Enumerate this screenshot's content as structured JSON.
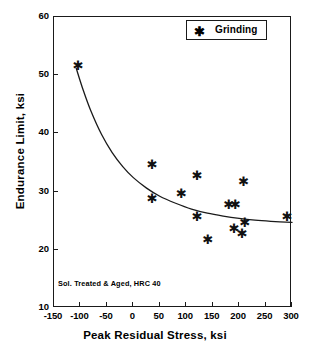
{
  "chart_data": {
    "type": "scatter",
    "title": "",
    "xlabel": "Peak Residual Stress, ksi",
    "ylabel": "Endurance Limit, ksi",
    "xlim": [
      -150,
      300
    ],
    "ylim": [
      10,
      60
    ],
    "xticks": [
      -150,
      -100,
      -50,
      0,
      50,
      100,
      150,
      200,
      250,
      300
    ],
    "yticks": [
      10,
      20,
      30,
      40,
      50,
      60
    ],
    "xticklabels": [
      "-150",
      "-100",
      "-50",
      "0",
      "50",
      "100",
      "150",
      "200",
      "250",
      "300"
    ],
    "yticklabels": [
      "10",
      "20",
      "30",
      "40",
      "50",
      "60"
    ],
    "grid": false,
    "legend_position": "top-right",
    "series": [
      {
        "name": "Grinding",
        "marker": "asterisk",
        "points": [
          {
            "x": -105,
            "y": 52
          },
          {
            "x": 35,
            "y": 35
          },
          {
            "x": 35,
            "y": 29
          },
          {
            "x": 90,
            "y": 30
          },
          {
            "x": 120,
            "y": 33
          },
          {
            "x": 120,
            "y": 26
          },
          {
            "x": 140,
            "y": 22
          },
          {
            "x": 180,
            "y": 28
          },
          {
            "x": 192,
            "y": 28
          },
          {
            "x": 190,
            "y": 24
          },
          {
            "x": 205,
            "y": 23
          },
          {
            "x": 208,
            "y": 32
          },
          {
            "x": 210,
            "y": 25
          },
          {
            "x": 290,
            "y": 26
          }
        ]
      }
    ],
    "fit_curve": {
      "name": "trend",
      "points": [
        {
          "x": -108,
          "y": 51.2
        },
        {
          "x": -95,
          "y": 47.5
        },
        {
          "x": -80,
          "y": 43.8
        },
        {
          "x": -60,
          "y": 39.8
        },
        {
          "x": -40,
          "y": 36.7
        },
        {
          "x": -20,
          "y": 34.3
        },
        {
          "x": 0,
          "y": 32.4
        },
        {
          "x": 25,
          "y": 30.6
        },
        {
          "x": 50,
          "y": 29.2
        },
        {
          "x": 80,
          "y": 28.0
        },
        {
          "x": 110,
          "y": 27.0
        },
        {
          "x": 140,
          "y": 26.3
        },
        {
          "x": 170,
          "y": 25.8
        },
        {
          "x": 200,
          "y": 25.4
        },
        {
          "x": 230,
          "y": 25.1
        },
        {
          "x": 260,
          "y": 24.9
        },
        {
          "x": 300,
          "y": 24.7
        }
      ]
    },
    "annotation": "Sol. Treated & Aged, HRC 40",
    "legend": [
      {
        "label": "Grinding",
        "marker": "✱"
      }
    ],
    "colors": {
      "axis": "#1a1a1a",
      "marker": "#111111",
      "curve": "#1a1a1a",
      "background": "#ffffff"
    }
  }
}
